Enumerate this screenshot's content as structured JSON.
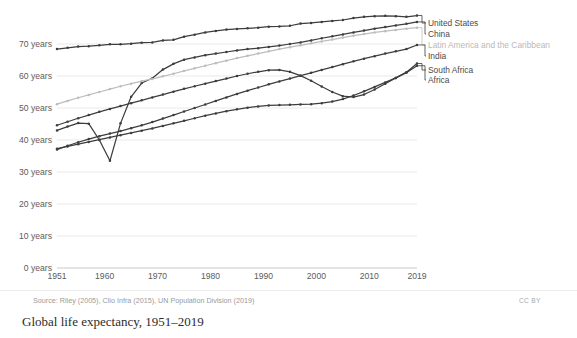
{
  "caption": "Global life expectancy, 1951–2019",
  "source_note": "Source: Riley (2005), Clio Infra (2015), UN Population Division (2019)",
  "license": "CC BY",
  "axes": {
    "y_ticks": [
      "0 years",
      "10 years",
      "20 years",
      "30 years",
      "40 years",
      "50 years",
      "60 years",
      "70 years"
    ],
    "x_ticks": [
      "1951",
      "1960",
      "1970",
      "1980",
      "1990",
      "2000",
      "2010",
      "2019"
    ]
  },
  "colors": {
    "line_dark": "#3d3d3d",
    "line_light": "#bdbdbd",
    "grid": "#e9e9e9",
    "axis_text": "#5c5c5c",
    "source_text": "#9a9a9a",
    "caption_text": "#2b2b2b"
  },
  "chart_data": {
    "type": "line",
    "title": "Global life expectancy, 1951–2019",
    "xlabel": "",
    "ylabel": "",
    "xlim": [
      1951,
      2019
    ],
    "ylim": [
      0,
      80
    ],
    "grid": true,
    "legend_position": "right",
    "y_tick_values": [
      0,
      10,
      20,
      30,
      40,
      50,
      60,
      70
    ],
    "x_tick_values": [
      1951,
      1960,
      1970,
      1980,
      1990,
      2000,
      2010,
      2019
    ],
    "x": [
      1951,
      1953,
      1955,
      1957,
      1959,
      1961,
      1963,
      1965,
      1967,
      1969,
      1971,
      1973,
      1975,
      1977,
      1979,
      1981,
      1983,
      1985,
      1987,
      1989,
      1991,
      1993,
      1995,
      1997,
      1999,
      2001,
      2003,
      2005,
      2007,
      2009,
      2011,
      2013,
      2015,
      2017,
      2019
    ],
    "series": [
      {
        "name": "United States",
        "color": "#3d3d3d",
        "values": [
          68.4,
          68.8,
          69.2,
          69.3,
          69.6,
          69.9,
          69.9,
          70.1,
          70.4,
          70.5,
          71.1,
          71.3,
          72.3,
          72.9,
          73.6,
          74.1,
          74.5,
          74.7,
          74.9,
          75.1,
          75.4,
          75.5,
          75.7,
          76.4,
          76.6,
          76.9,
          77.2,
          77.5,
          78.1,
          78.5,
          78.7,
          78.8,
          78.7,
          78.5,
          78.9
        ]
      },
      {
        "name": "China",
        "color": "#3d3d3d",
        "values": [
          43.0,
          44.2,
          45.3,
          45.1,
          40.0,
          33.5,
          45.2,
          53.5,
          57.8,
          59.3,
          62.0,
          63.8,
          65.1,
          65.8,
          66.5,
          67.0,
          67.5,
          68.0,
          68.4,
          68.7,
          69.1,
          69.5,
          70.0,
          70.5,
          71.1,
          71.8,
          72.4,
          73.0,
          73.6,
          74.2,
          74.8,
          75.3,
          75.8,
          76.3,
          76.9
        ]
      },
      {
        "name": "Latin America and the Caribbean",
        "color": "#bdbdbd",
        "values": [
          51.2,
          52.2,
          53.2,
          54.1,
          55.0,
          55.9,
          56.8,
          57.6,
          58.4,
          59.1,
          59.9,
          60.7,
          61.6,
          62.4,
          63.2,
          64.0,
          64.8,
          65.6,
          66.3,
          67.0,
          67.7,
          68.4,
          69.0,
          69.6,
          70.2,
          70.8,
          71.4,
          72.0,
          72.6,
          73.1,
          73.6,
          74.0,
          74.4,
          74.8,
          75.1
        ]
      },
      {
        "name": "India",
        "color": "#3d3d3d",
        "values": [
          37.0,
          38.2,
          39.3,
          40.3,
          41.2,
          42.0,
          42.8,
          43.7,
          44.6,
          45.6,
          46.7,
          47.8,
          48.9,
          50.0,
          51.1,
          52.2,
          53.3,
          54.4,
          55.4,
          56.4,
          57.4,
          58.3,
          59.2,
          60.1,
          61.0,
          61.9,
          62.8,
          63.7,
          64.6,
          65.4,
          66.2,
          67.0,
          67.7,
          68.4,
          69.7
        ]
      },
      {
        "name": "South Africa",
        "color": "#3d3d3d",
        "values": [
          44.6,
          45.7,
          46.8,
          47.8,
          48.8,
          49.7,
          50.6,
          51.5,
          52.4,
          53.3,
          54.2,
          55.1,
          56.0,
          56.8,
          57.6,
          58.4,
          59.2,
          60.0,
          60.7,
          61.3,
          61.8,
          61.9,
          61.3,
          60.1,
          58.5,
          56.7,
          55.0,
          53.7,
          53.4,
          54.2,
          55.8,
          57.6,
          59.4,
          61.2,
          63.9
        ]
      },
      {
        "name": "Africa",
        "color": "#3d3d3d",
        "values": [
          37.3,
          38.0,
          38.7,
          39.4,
          40.1,
          40.8,
          41.5,
          42.2,
          42.9,
          43.6,
          44.4,
          45.2,
          46.0,
          46.8,
          47.6,
          48.3,
          49.0,
          49.6,
          50.1,
          50.5,
          50.8,
          50.9,
          51.0,
          51.1,
          51.2,
          51.5,
          52.0,
          52.8,
          53.9,
          55.2,
          56.6,
          58.0,
          59.4,
          61.0,
          63.2
        ]
      }
    ]
  },
  "legend": [
    {
      "label": "United States"
    },
    {
      "label": "China"
    },
    {
      "label": "Latin America and the Caribbean"
    },
    {
      "label": "India"
    },
    {
      "label": "South Africa"
    },
    {
      "label": "Africa"
    }
  ]
}
